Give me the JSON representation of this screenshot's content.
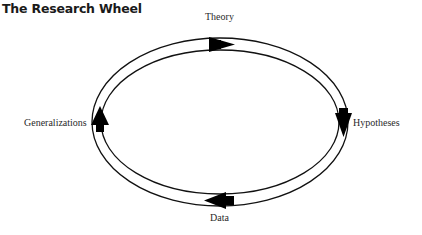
{
  "title": "The Research Wheel",
  "diagram": {
    "type": "cycle",
    "nodes": [
      {
        "id": "theory",
        "label": "Theory",
        "position": "top"
      },
      {
        "id": "hypotheses",
        "label": "Hypotheses",
        "position": "right"
      },
      {
        "id": "data",
        "label": "Data",
        "position": "bottom"
      },
      {
        "id": "generalizations",
        "label": "Generalizations",
        "position": "left"
      }
    ],
    "edges": [
      {
        "from": "theory",
        "to": "hypotheses",
        "direction": "clockwise"
      },
      {
        "from": "hypotheses",
        "to": "data",
        "direction": "clockwise"
      },
      {
        "from": "data",
        "to": "generalizations",
        "direction": "clockwise"
      },
      {
        "from": "generalizations",
        "to": "theory",
        "direction": "clockwise"
      }
    ],
    "colors": {
      "stroke": "#111111",
      "arrow": "#000000",
      "text": "#2a2a2a"
    }
  }
}
